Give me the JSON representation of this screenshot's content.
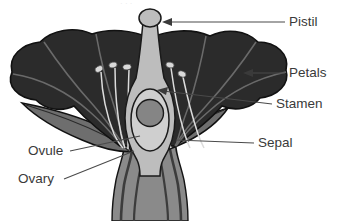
{
  "diagram": {
    "background_color": "#ffffff",
    "labels": [
      {
        "id": "pistil",
        "text": "Pistil",
        "x": 289,
        "y": 26,
        "anchor": "start"
      },
      {
        "id": "petals",
        "text": "Petals",
        "x": 289,
        "y": 77,
        "anchor": "start"
      },
      {
        "id": "stamen",
        "text": "Stamen",
        "x": 276,
        "y": 108,
        "anchor": "start"
      },
      {
        "id": "sepal",
        "text": "Sepal",
        "x": 258,
        "y": 147,
        "anchor": "start"
      },
      {
        "id": "ovule",
        "text": "Ovule",
        "x": 28,
        "y": 155,
        "anchor": "start"
      },
      {
        "id": "ovary",
        "text": "Ovary",
        "x": 18,
        "y": 183,
        "anchor": "start"
      }
    ],
    "colors": {
      "petal": "#2b2b2b",
      "petal_outline": "#111111",
      "sepal": "#6e6e6e",
      "sepal_outline": "#111111",
      "stem": "#8a8a8a",
      "stem_vein": "#3c3c3c",
      "pistil": "#b9b9b9",
      "pistil_outline": "#1a1a1a",
      "ovary": "#c9c9c9",
      "ovule": "#858585",
      "anther": "#d9d9d9",
      "filament": "#e2e2e2",
      "label_text": "#3a3a3a",
      "leader_line": "#4a4a4a"
    },
    "parts": {
      "pistil_name": "pistil-stigma-and-style",
      "petals_name": "petals-corolla",
      "stamen_name": "stamen-filament-anther",
      "sepal_name": "sepal-calyx",
      "ovary_name": "ovary",
      "ovule_name": "ovule",
      "stem_name": "flower-stem-receptacle"
    },
    "stamens": {
      "count": 6,
      "anthers": [
        {
          "cx": 99,
          "cy": 69,
          "rx": 4.0,
          "ry": 2.8,
          "rot": -28
        },
        {
          "cx": 113,
          "cy": 65,
          "rx": 4.0,
          "ry": 2.8,
          "rot": -14
        },
        {
          "cx": 127,
          "cy": 67,
          "rx": 4.0,
          "ry": 2.8,
          "rot": -8
        },
        {
          "cx": 157,
          "cy": 66,
          "rx": 4.0,
          "ry": 2.8,
          "rot": 10
        },
        {
          "cx": 170,
          "cy": 65,
          "rx": 4.0,
          "ry": 2.8,
          "rot": 14
        },
        {
          "cx": 182,
          "cy": 74,
          "rx": 4.0,
          "ry": 2.8,
          "rot": 22
        }
      ]
    },
    "ghost_header": "· · ·"
  }
}
